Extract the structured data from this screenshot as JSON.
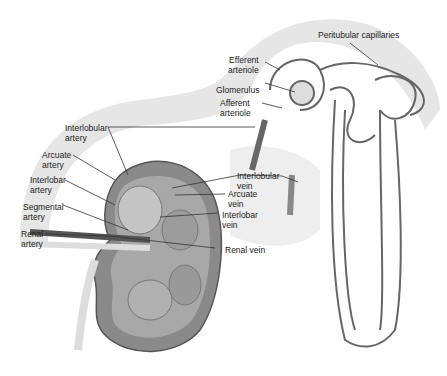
{
  "diagram": {
    "colors": {
      "band": "#e6e6e6",
      "vessel_dark": "#555555",
      "vessel_light": "#cfcfcf",
      "kidney": "#8a8a8a"
    },
    "labels": {
      "peritubular_capillaries": "Peritubular capillaries",
      "efferent_arteriole": "Efferent\narteriole",
      "glomerulus": "Glomerulus",
      "afferent_arteriole": "Afferent\narteriole",
      "interlobular_artery": "Interlobular\nartery",
      "arcuate_artery": "Arcuate\nartery",
      "interlobar_artery": "Interlobar\nartery",
      "segmental_artery": "Segmental\nartery",
      "renal_artery": "Renal\nartery",
      "interlobular_vein": "Interlobular\nvein",
      "arcuate_vein": "Arcuate\nvein",
      "interlobar_vein": "Interlobar\nvein",
      "renal_vein": "Renal vein"
    }
  }
}
